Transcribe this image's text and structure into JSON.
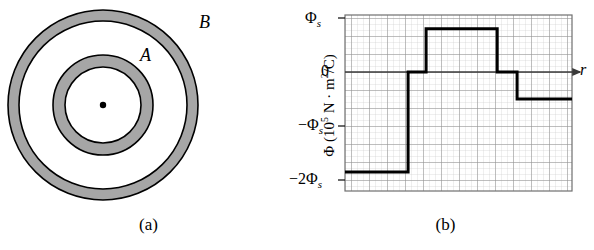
{
  "figure": {
    "panel_a": {
      "caption": "(a)",
      "labels": {
        "inner_shell": "A",
        "outer_shell": "B"
      },
      "geometry": {
        "center_x": 103,
        "center_y": 105,
        "point_charge_radius": 3,
        "shell_A_inner_radius": 38,
        "shell_A_outer_radius": 50,
        "shell_B_inner_radius": 84,
        "shell_B_outer_radius": 95
      },
      "colors": {
        "shell_fill": "#a6a6a6",
        "outline": "#000000",
        "background": "#ffffff"
      }
    },
    "panel_b": {
      "caption": "(b)",
      "axis": {
        "y_label": "Φ (10⁵ N · m²/C)",
        "y_label_prefix": "Φ (10",
        "y_label_exponent": "5",
        "y_label_suffix": " N · m",
        "y_label_exponent2": "2",
        "y_label_suffix2": "/C)",
        "x_label": "r",
        "y_ticks": [
          "Φ",
          "0",
          "−Φ",
          "−2Φ"
        ],
        "y_tick_labels": [
          {
            "main": "Φ",
            "sub": "s",
            "value": 1
          },
          {
            "main": "0",
            "sub": "",
            "value": 0
          },
          {
            "main": "−Φ",
            "sub": "s",
            "value": -1
          },
          {
            "main": "−2Φ",
            "sub": "s",
            "value": -2
          }
        ],
        "grid": "on",
        "grid_major_px": 18,
        "grid_minor_px": 6
      }
    }
  },
  "chart_data": {
    "type": "line",
    "title": "",
    "xlabel": "r",
    "ylabel": "Φ (10⁵ N · m²/C)",
    "xlim": [
      0,
      12.6
    ],
    "ylim": [
      -2.2,
      1.05
    ],
    "ytick_values": [
      1,
      0,
      -1,
      -2
    ],
    "ytick_labels": [
      "Φ_s",
      "0",
      "−Φ_s",
      "−2Φ_s"
    ],
    "grid": true,
    "legend": "none",
    "step_style": "step-post",
    "series": [
      {
        "name": "Flux vs radius",
        "color": "#000000",
        "linewidth": 3,
        "x": [
          0.0,
          3.5,
          3.5,
          4.5,
          4.5,
          8.45,
          8.45,
          9.55,
          9.55,
          12.6
        ],
        "y": [
          -1.85,
          -1.85,
          0.0,
          0.0,
          0.8,
          0.8,
          0.0,
          0.0,
          -0.5,
          -0.5
        ],
        "steps": [
          {
            "x_start": 0.0,
            "x_end": 3.5,
            "value": -1.85,
            "label": "inside shell A cavity region"
          },
          {
            "x_start": 3.5,
            "x_end": 4.5,
            "value": 0.0,
            "label": "after shell A"
          },
          {
            "x_start": 4.5,
            "x_end": 8.45,
            "value": 0.8,
            "label": "between shells"
          },
          {
            "x_start": 8.45,
            "x_end": 9.55,
            "value": 0.0,
            "label": "after shell B inner"
          },
          {
            "x_start": 9.55,
            "x_end": 12.6,
            "value": -0.5,
            "label": "outside shell B"
          }
        ]
      }
    ]
  }
}
